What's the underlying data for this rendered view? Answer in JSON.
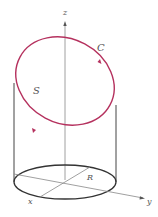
{
  "labels": {
    "z_axis": "z",
    "y_axis": "y",
    "x_axis": "x",
    "curve": "C",
    "surface": "S",
    "radius": "R"
  },
  "colors": {
    "curve": "#b5315e",
    "axes": "#777777",
    "cylinder": "#333333",
    "text": "#555555"
  }
}
